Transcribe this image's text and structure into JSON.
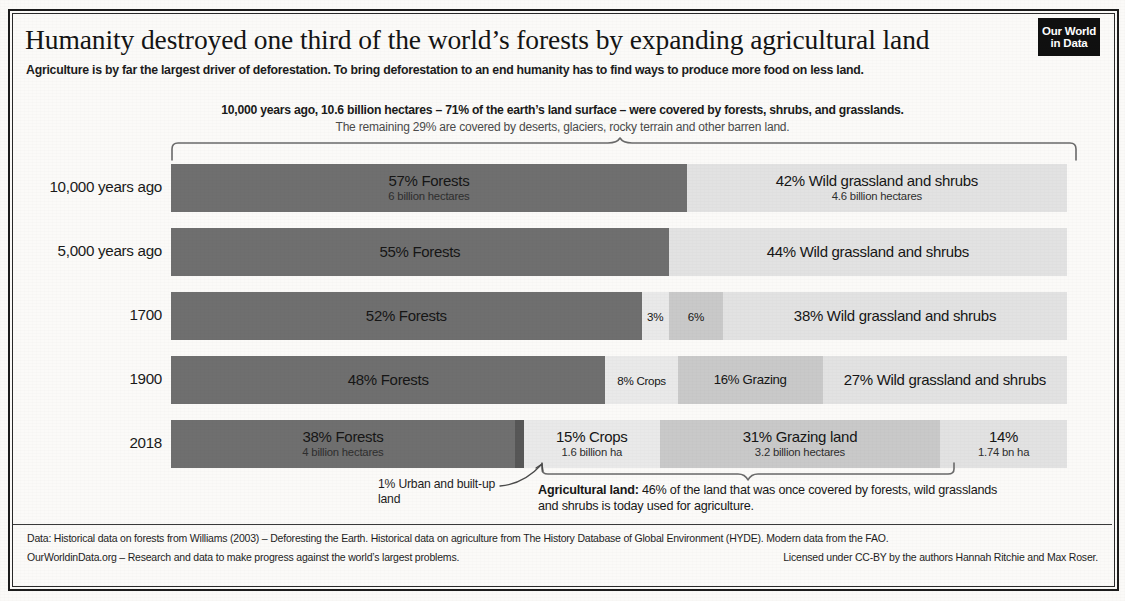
{
  "header": {
    "title": "Humanity destroyed one third of the world’s forests by expanding agricultural land",
    "subtitle": "Agriculture is by far the largest driver of deforestation. To bring deforestation to an end humanity has to find ways to produce more food on less land.",
    "logo_line1": "Our World",
    "logo_line2": "in Data"
  },
  "top_note": {
    "line1": "10,000 years ago, 10.6 billion hectares – 71% of the earth’s land surface – were covered by forests, shrubs, and grasslands.",
    "line2": "The remaining 29% are covered by deserts, glaciers, rocky terrain and other barren land."
  },
  "annotations": {
    "urban_note": "1% Urban and built-up land",
    "agri_label": "Agricultural land:",
    "agri_text": " 46% of the land that was once covered by forests, wild grasslands and shrubs is today used for agriculture."
  },
  "footer": {
    "line1": "Data: Historical data on forests from Williams (2003) – Deforesting the Earth. Historical data on agriculture from The History Database of Global Environment (HYDE). Modern data from the FAO.",
    "line2_left": "OurWorldinData.org – Research and data to make progress against the world’s largest problems.",
    "line2_right": "Licensed under CC-BY by the authors Hannah Ritchie and Max Roser."
  },
  "chart_data": {
    "type": "bar",
    "orientation": "horizontal",
    "stacked": true,
    "title": "Humanity destroyed one third of the world’s forests by expanding agricultural land",
    "xlabel": "",
    "ylabel": "",
    "xlim": [
      0,
      100
    ],
    "grid": false,
    "legend": "none",
    "categories": [
      "10,000 years ago",
      "5,000 years ago",
      "1700",
      "1900",
      "2018"
    ],
    "series": [
      {
        "name": "Forests",
        "color": "#6f6f6f",
        "values": [
          57,
          55,
          52,
          48,
          38
        ]
      },
      {
        "name": "Urban and built-up land",
        "color": "#575757",
        "values": [
          0,
          0,
          0,
          0,
          1
        ]
      },
      {
        "name": "Crops",
        "color": "#e9e9e9",
        "values": [
          0,
          0,
          3,
          8,
          15
        ]
      },
      {
        "name": "Grazing land",
        "color": "#c9c9c9",
        "values": [
          0,
          0,
          6,
          16,
          31
        ]
      },
      {
        "name": "Wild grassland and shrubs",
        "color": "#e2e2e2",
        "values": [
          42,
          44,
          38,
          27,
          14
        ]
      }
    ],
    "rows": [
      {
        "label": "10,000 years ago",
        "segments": [
          {
            "key": "forests",
            "value": 57,
            "color": "#6f6f6f",
            "label": "57% Forests",
            "sublabel": "6 billion hectares",
            "size": "normal"
          },
          {
            "key": "wild",
            "value": 42,
            "color": "#e2e2e2",
            "label": "42% Wild grassland and shrubs",
            "sublabel": "4.6 billion hectares",
            "size": "normal"
          }
        ]
      },
      {
        "label": "5,000 years ago",
        "segments": [
          {
            "key": "forests",
            "value": 55,
            "color": "#6f6f6f",
            "label": "55% Forests",
            "sublabel": "",
            "size": "normal"
          },
          {
            "key": "wild",
            "value": 44,
            "color": "#e2e2e2",
            "label": "44% Wild grassland and shrubs",
            "sublabel": "",
            "size": "normal"
          }
        ]
      },
      {
        "label": "1700",
        "segments": [
          {
            "key": "forests",
            "value": 52,
            "color": "#6f6f6f",
            "label": "52% Forests",
            "sublabel": "",
            "size": "normal"
          },
          {
            "key": "crops",
            "value": 3,
            "color": "#e9e9e9",
            "label": "3%",
            "sublabel": "",
            "size": "tiny"
          },
          {
            "key": "grazing",
            "value": 6,
            "color": "#c9c9c9",
            "label": "6%",
            "sublabel": "",
            "size": "tiny"
          },
          {
            "key": "wild",
            "value": 38,
            "color": "#e2e2e2",
            "label": "38% Wild grassland and shrubs",
            "sublabel": "",
            "size": "normal"
          }
        ]
      },
      {
        "label": "1900",
        "segments": [
          {
            "key": "forests",
            "value": 48,
            "color": "#6f6f6f",
            "label": "48% Forests",
            "sublabel": "",
            "size": "normal"
          },
          {
            "key": "crops",
            "value": 8,
            "color": "#e9e9e9",
            "label": "8% Crops",
            "sublabel": "",
            "size": "tiny"
          },
          {
            "key": "grazing",
            "value": 16,
            "color": "#c9c9c9",
            "label": "16% Grazing",
            "sublabel": "",
            "size": "small"
          },
          {
            "key": "wild",
            "value": 27,
            "color": "#e2e2e2",
            "label": "27% Wild grassland and shrubs",
            "sublabel": "",
            "size": "two"
          }
        ]
      },
      {
        "label": "2018",
        "segments": [
          {
            "key": "forests",
            "value": 38,
            "color": "#6f6f6f",
            "label": "38% Forests",
            "sublabel": "4 billion hectares",
            "size": "normal"
          },
          {
            "key": "urban",
            "value": 1,
            "color": "#575757",
            "label": "",
            "sublabel": "",
            "size": "normal"
          },
          {
            "key": "crops",
            "value": 15,
            "color": "#e9e9e9",
            "label": "15% Crops",
            "sublabel": "1.6 billion ha",
            "size": "normal"
          },
          {
            "key": "grazing",
            "value": 31,
            "color": "#c9c9c9",
            "label": "31% Grazing land",
            "sublabel": "3.2 billion hectares",
            "size": "normal"
          },
          {
            "key": "wild",
            "value": 14,
            "color": "#e2e2e2",
            "label": "14%",
            "sublabel": "1.74 bn ha",
            "size": "normal"
          }
        ]
      }
    ]
  }
}
